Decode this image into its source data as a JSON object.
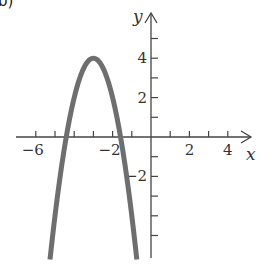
{
  "panel_label": "b)",
  "colors": {
    "curve": "#6e6e6e",
    "axis": "#444444",
    "text": "#333333"
  },
  "chart_data": {
    "type": "line",
    "title": "",
    "xlabel": "x",
    "ylabel": "y",
    "function": "y = -2(x + 3)^2 + 4",
    "vertex": [
      -3,
      4
    ],
    "x_intercepts": [
      -4.41,
      -1.59
    ],
    "xlim": [
      -7,
      5
    ],
    "ylim": [
      -6.2,
      5.5
    ],
    "x_ticks": [
      -6,
      -5,
      -4,
      -3,
      -2,
      -1,
      1,
      2,
      3,
      4
    ],
    "x_tick_labels": [
      {
        "value": -6,
        "label": "−6"
      },
      {
        "value": -2,
        "label": "−2"
      },
      {
        "value": 2,
        "label": "2"
      },
      {
        "value": 4,
        "label": "4"
      }
    ],
    "y_ticks": [
      -5,
      -4,
      -3,
      -2,
      -1,
      1,
      2,
      3,
      4,
      5
    ],
    "y_tick_labels": [
      {
        "value": 4,
        "label": "4"
      },
      {
        "value": 2,
        "label": "2"
      },
      {
        "value": -2,
        "label": "−2"
      }
    ],
    "grid": false,
    "series": [
      {
        "name": "parabola",
        "x": [
          -5.26,
          -5,
          -4.5,
          -4.41,
          -4,
          -3.5,
          -3,
          -2.5,
          -2,
          -1.59,
          -1.5,
          -1,
          -0.74
        ],
        "y": [
          -6.2,
          -4,
          -0.5,
          0,
          2,
          3.5,
          4,
          3.5,
          2,
          0,
          -0.5,
          -4,
          -6.2
        ]
      }
    ]
  }
}
